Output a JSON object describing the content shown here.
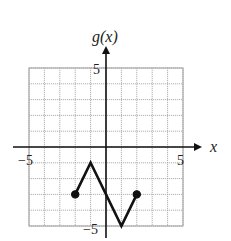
{
  "chart_data": {
    "type": "line",
    "title": "",
    "xlabel": "x",
    "ylabel": "g(x)",
    "xlim": [
      -5,
      5
    ],
    "ylim": [
      -5,
      5
    ],
    "grid": true,
    "grid_step": 1,
    "tick_labels": {
      "x": [
        "-5",
        "5"
      ],
      "y": [
        "5",
        "-5"
      ]
    },
    "series": [
      {
        "name": "g(x)",
        "points": [
          [
            -2,
            -3
          ],
          [
            -1,
            -1
          ],
          [
            1,
            -5
          ],
          [
            2,
            -3
          ]
        ],
        "endpoints": [
          {
            "x": -2,
            "y": -3,
            "style": "closed"
          },
          {
            "x": 2,
            "y": -3,
            "style": "closed"
          }
        ]
      }
    ],
    "legend": null
  },
  "labels": {
    "x_axis": "x",
    "y_axis": "g(x)",
    "x_min": "−5",
    "x_max": "5",
    "y_max": "5",
    "y_min": "−5"
  }
}
